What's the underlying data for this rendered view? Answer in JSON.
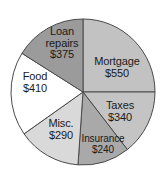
{
  "chart_data": {
    "type": "pie",
    "title": "",
    "subtitle": "",
    "xlabel": "",
    "ylabel": "",
    "legend_position": "none",
    "grid": false,
    "currency": "$",
    "total": 2205,
    "categories": [
      "Mortgage",
      "Taxes",
      "Insurance",
      "Misc.",
      "Food",
      "Loan repairs"
    ],
    "values": [
      550,
      340,
      240,
      290,
      410,
      375
    ],
    "slices": [
      {
        "name": "Mortgage",
        "value": 550,
        "label_name": "Mortgage",
        "label_value": "$550",
        "color": "#c2c2c2",
        "start_angle": -90,
        "end_angle": 0
      },
      {
        "name": "Taxes",
        "value": 340,
        "label_name": "Taxes",
        "label_value": "$340",
        "color": "#c4c4c4",
        "start_angle": 0,
        "end_angle": 52
      },
      {
        "name": "Insurance",
        "value": 240,
        "label_name": "Insurance",
        "label_value": "$240",
        "color": "#a9a9a9",
        "start_angle": 52,
        "end_angle": 94
      },
      {
        "name": "Misc.",
        "value": 290,
        "label_name": "Misc.",
        "label_value": "$290",
        "color": "#d9d9d9",
        "start_angle": 94,
        "end_angle": 145
      },
      {
        "name": "Food",
        "value": 410,
        "label_name": "Food",
        "label_value": "$410",
        "color": "#ffffff",
        "start_angle": 145,
        "end_angle": 212
      },
      {
        "name": "Loan repairs",
        "value": 375,
        "label_name_line1": "Loan",
        "label_name_line2": "repairs",
        "label_value": "$375",
        "color": "#9b9b9b",
        "start_angle": 212,
        "end_angle": 270
      }
    ]
  },
  "geometry": {
    "cx": 83,
    "cy": 92,
    "rx": 72,
    "ry": 73
  },
  "colors": {
    "outline": "#4a4a4a",
    "text": "#1a1a1a",
    "background": "#ffffff"
  }
}
